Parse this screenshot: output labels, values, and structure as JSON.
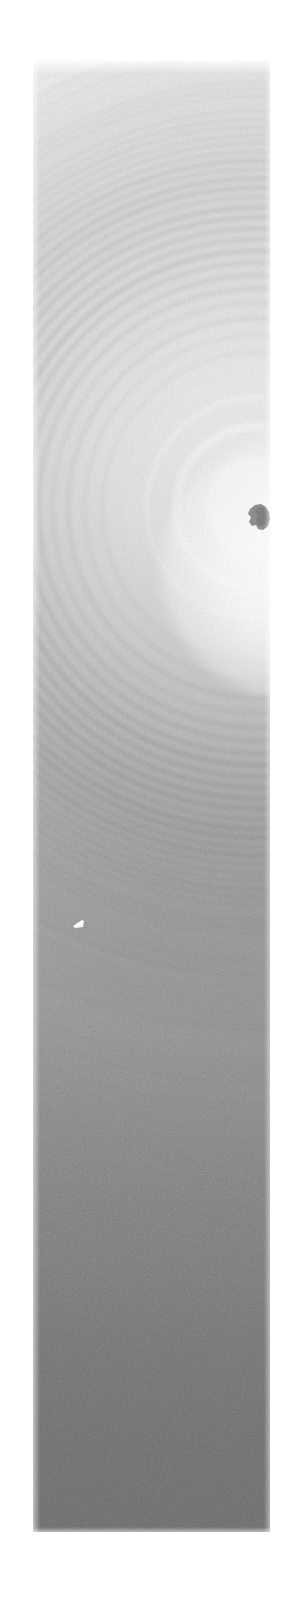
{
  "image": {
    "subject": "Newton's rings interference fringe pattern photograph",
    "medium": "grayscale photographic plate / film scan",
    "orientation": "portrait strip",
    "page_background": "#ffffff",
    "plate": {
      "left": 33,
      "top": 60,
      "width": 237,
      "height": 1472
    },
    "tone": {
      "description": "vertical gradient from near-white at top to medium grey at bottom",
      "top_color": "#ffffff",
      "mid_color": "#b0b0b0",
      "bottom_color": "#6e6e6e",
      "stops": [
        {
          "pos": 0,
          "color": "#ffffff"
        },
        {
          "pos": 13,
          "color": "#fafafa"
        },
        {
          "pos": 27,
          "color": "#f0f0f0"
        },
        {
          "pos": 39,
          "color": "#dcdcdc"
        },
        {
          "pos": 51,
          "color": "#c0c0c0"
        },
        {
          "pos": 63,
          "color": "#a0a0a0"
        },
        {
          "pos": 73,
          "color": "#8a8a8a"
        },
        {
          "pos": 83,
          "color": "#7b7b7b"
        },
        {
          "pos": 93,
          "color": "#717171"
        },
        {
          "pos": 100,
          "color": "#6e6e6e"
        }
      ]
    },
    "pattern": {
      "type": "concentric-circular-fringes",
      "center_x": 258,
      "center_y": 508,
      "center_x_in_plate": 225,
      "center_y_in_plate": 448,
      "radius_law": "r = k * sqrt(n)",
      "scale_k": 78,
      "ring_count": 46,
      "fringe_color": "#5d5d5d",
      "note": "fringe spacing decreases with radius; contrast decays outward and is lost in grain below the midpoint"
    },
    "defects": [
      {
        "name": "dark-blob",
        "description": "irregular dark speck near ring centre at right edge",
        "x": 246,
        "y": 503,
        "width": 25,
        "height": 28,
        "color": "#8d8d8d"
      },
      {
        "name": "bright-speck",
        "description": "small white triangular flaw on a dark fringe, left of centre",
        "x": 72,
        "y": 918,
        "width": 13,
        "height": 12,
        "color": "#fdfdfd"
      }
    ],
    "grain": {
      "description": "fine photographic film grain over whole plate",
      "opacity": 0.3
    }
  },
  "rings": [
    {
      "n": 1,
      "r": 78,
      "w": 26,
      "o": 0.05
    },
    {
      "n": 2,
      "r": 110,
      "w": 24,
      "o": 0.065
    },
    {
      "n": 3,
      "r": 135,
      "w": 22,
      "o": 0.08
    },
    {
      "n": 4,
      "r": 156,
      "w": 21,
      "o": 0.095
    },
    {
      "n": 5,
      "r": 174,
      "w": 20,
      "o": 0.11
    },
    {
      "n": 6,
      "r": 191,
      "w": 19,
      "o": 0.125
    },
    {
      "n": 7,
      "r": 206,
      "w": 18,
      "o": 0.14
    },
    {
      "n": 8,
      "r": 221,
      "w": 17,
      "o": 0.155
    },
    {
      "n": 9,
      "r": 234,
      "w": 16,
      "o": 0.17
    },
    {
      "n": 10,
      "r": 247,
      "w": 16,
      "o": 0.18
    },
    {
      "n": 11,
      "r": 259,
      "w": 15,
      "o": 0.19
    },
    {
      "n": 12,
      "r": 270,
      "w": 15,
      "o": 0.2
    },
    {
      "n": 13,
      "r": 281,
      "w": 14,
      "o": 0.205
    },
    {
      "n": 14,
      "r": 292,
      "w": 14,
      "o": 0.21
    },
    {
      "n": 15,
      "r": 302,
      "w": 13,
      "o": 0.215
    },
    {
      "n": 16,
      "r": 312,
      "w": 13,
      "o": 0.218
    },
    {
      "n": 17,
      "r": 322,
      "w": 12,
      "o": 0.22
    },
    {
      "n": 18,
      "r": 331,
      "w": 12,
      "o": 0.22
    },
    {
      "n": 19,
      "r": 340,
      "w": 12,
      "o": 0.218
    },
    {
      "n": 20,
      "r": 349,
      "w": 11,
      "o": 0.215
    },
    {
      "n": 21,
      "r": 357,
      "w": 11,
      "o": 0.212
    },
    {
      "n": 22,
      "r": 366,
      "w": 11,
      "o": 0.208
    },
    {
      "n": 23,
      "r": 374,
      "w": 10,
      "o": 0.204
    },
    {
      "n": 24,
      "r": 382,
      "w": 10,
      "o": 0.2
    },
    {
      "n": 25,
      "r": 390,
      "w": 10,
      "o": 0.195
    },
    {
      "n": 26,
      "r": 398,
      "w": 10,
      "o": 0.19
    },
    {
      "n": 27,
      "r": 405,
      "w": 9,
      "o": 0.185
    },
    {
      "n": 28,
      "r": 413,
      "w": 9,
      "o": 0.18
    },
    {
      "n": 29,
      "r": 420,
      "w": 9,
      "o": 0.174
    },
    {
      "n": 30,
      "r": 427,
      "w": 9,
      "o": 0.168
    },
    {
      "n": 31,
      "r": 434,
      "w": 9,
      "o": 0.162
    },
    {
      "n": 32,
      "r": 441,
      "w": 8,
      "o": 0.156
    },
    {
      "n": 33,
      "r": 448,
      "w": 8,
      "o": 0.15
    },
    {
      "n": 34,
      "r": 455,
      "w": 8,
      "o": 0.144
    },
    {
      "n": 35,
      "r": 461,
      "w": 8,
      "o": 0.138
    },
    {
      "n": 36,
      "r": 468,
      "w": 8,
      "o": 0.132
    },
    {
      "n": 37,
      "r": 474,
      "w": 8,
      "o": 0.126
    },
    {
      "n": 38,
      "r": 481,
      "w": 7,
      "o": 0.12
    },
    {
      "n": 39,
      "r": 487,
      "w": 7,
      "o": 0.114
    },
    {
      "n": 40,
      "r": 493,
      "w": 7,
      "o": 0.108
    },
    {
      "n": 41,
      "r": 499,
      "w": 7,
      "o": 0.102
    },
    {
      "n": 42,
      "r": 505,
      "w": 7,
      "o": 0.096
    },
    {
      "n": 43,
      "r": 511,
      "w": 7,
      "o": 0.09
    },
    {
      "n": 44,
      "r": 517,
      "w": 7,
      "o": 0.084
    },
    {
      "n": 45,
      "r": 523,
      "w": 7,
      "o": 0.078
    },
    {
      "n": 46,
      "r": 528,
      "w": 7,
      "o": 0.072
    }
  ],
  "fine_rings": [
    {
      "n": 47,
      "r": 534,
      "w": 6,
      "o": 0.07
    },
    {
      "n": 48,
      "r": 540,
      "w": 6,
      "o": 0.068
    },
    {
      "n": 49,
      "r": 546,
      "w": 6,
      "o": 0.066
    },
    {
      "n": 50,
      "r": 552,
      "w": 6,
      "o": 0.064
    },
    {
      "n": 51,
      "r": 558,
      "w": 6,
      "o": 0.062
    },
    {
      "n": 52,
      "r": 563,
      "w": 6,
      "o": 0.06
    },
    {
      "n": 53,
      "r": 569,
      "w": 6,
      "o": 0.058
    },
    {
      "n": 54,
      "r": 575,
      "w": 6,
      "o": 0.056
    },
    {
      "n": 55,
      "r": 580,
      "w": 6,
      "o": 0.054
    },
    {
      "n": 56,
      "r": 586,
      "w": 5,
      "o": 0.052
    },
    {
      "n": 57,
      "r": 591,
      "w": 5,
      "o": 0.05
    },
    {
      "n": 58,
      "r": 597,
      "w": 5,
      "o": 0.048
    },
    {
      "n": 59,
      "r": 602,
      "w": 5,
      "o": 0.046
    },
    {
      "n": 60,
      "r": 607,
      "w": 5,
      "o": 0.045
    },
    {
      "n": 61,
      "r": 613,
      "w": 5,
      "o": 0.044
    },
    {
      "n": 62,
      "r": 618,
      "w": 5,
      "o": 0.043
    },
    {
      "n": 63,
      "r": 623,
      "w": 5,
      "o": 0.042
    },
    {
      "n": 64,
      "r": 628,
      "w": 5,
      "o": 0.041
    },
    {
      "n": 65,
      "r": 633,
      "w": 5,
      "o": 0.04
    },
    {
      "n": 66,
      "r": 638,
      "w": 5,
      "o": 0.039
    },
    {
      "n": 67,
      "r": 643,
      "w": 5,
      "o": 0.038
    },
    {
      "n": 68,
      "r": 648,
      "w": 5,
      "o": 0.037
    },
    {
      "n": 69,
      "r": 653,
      "w": 5,
      "o": 0.036
    },
    {
      "n": 70,
      "r": 658,
      "w": 5,
      "o": 0.035
    },
    {
      "n": 71,
      "r": 663,
      "w": 5,
      "o": 0.034
    },
    {
      "n": 72,
      "r": 668,
      "w": 5,
      "o": 0.033
    },
    {
      "n": 73,
      "r": 673,
      "w": 5,
      "o": 0.032
    },
    {
      "n": 74,
      "r": 677,
      "w": 5,
      "o": 0.031
    },
    {
      "n": 75,
      "r": 682,
      "w": 5,
      "o": 0.03
    },
    {
      "n": 76,
      "r": 687,
      "w": 4,
      "o": 0.029
    },
    {
      "n": 77,
      "r": 691,
      "w": 4,
      "o": 0.028
    },
    {
      "n": 78,
      "r": 696,
      "w": 4,
      "o": 0.027
    },
    {
      "n": 79,
      "r": 701,
      "w": 4,
      "o": 0.026
    },
    {
      "n": 80,
      "r": 705,
      "w": 4,
      "o": 0.025
    },
    {
      "n": 81,
      "r": 710,
      "w": 4,
      "o": 0.024
    },
    {
      "n": 82,
      "r": 714,
      "w": 4,
      "o": 0.023
    },
    {
      "n": 83,
      "r": 719,
      "w": 4,
      "o": 0.022
    },
    {
      "n": 84,
      "r": 723,
      "w": 4,
      "o": 0.021
    },
    {
      "n": 85,
      "r": 728,
      "w": 4,
      "o": 0.02
    },
    {
      "n": 86,
      "r": 732,
      "w": 4,
      "o": 0.019
    },
    {
      "n": 87,
      "r": 736,
      "w": 4,
      "o": 0.018
    },
    {
      "n": 88,
      "r": 741,
      "w": 4,
      "o": 0.017
    },
    {
      "n": 89,
      "r": 745,
      "w": 4,
      "o": 0.016
    },
    {
      "n": 90,
      "r": 749,
      "w": 4,
      "o": 0.015
    },
    {
      "n": 91,
      "r": 754,
      "w": 4,
      "o": 0.014
    },
    {
      "n": 92,
      "r": 758,
      "w": 4,
      "o": 0.013
    },
    {
      "n": 93,
      "r": 762,
      "w": 4,
      "o": 0.012
    },
    {
      "n": 94,
      "r": 766,
      "w": 4,
      "o": 0.011
    },
    {
      "n": 95,
      "r": 770,
      "w": 4,
      "o": 0.01
    }
  ]
}
